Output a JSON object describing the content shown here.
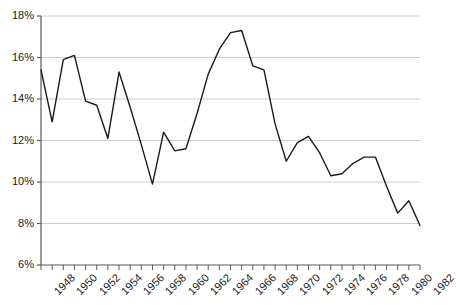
{
  "chart_data": {
    "type": "line",
    "title": "",
    "xlabel": "",
    "ylabel": "",
    "xlim": [
      1948,
      1982
    ],
    "ylim": [
      6,
      18
    ],
    "grid": true,
    "legend": null,
    "y_tick_labels": [
      "18%",
      "16%",
      "14%",
      "12%",
      "10%",
      "8%",
      "6%"
    ],
    "y_ticks": [
      18,
      16,
      14,
      12,
      10,
      8,
      6
    ],
    "x_tick_labels": [
      "1948",
      "1950",
      "1952",
      "1954",
      "1956",
      "1958",
      "1960",
      "1962",
      "1964",
      "1966",
      "1968",
      "1970",
      "1972",
      "1974",
      "1976",
      "1978",
      "1980",
      "1982"
    ],
    "x_ticks": [
      1948,
      1950,
      1952,
      1954,
      1956,
      1958,
      1960,
      1962,
      1964,
      1966,
      1968,
      1970,
      1972,
      1974,
      1976,
      1978,
      1980,
      1982
    ],
    "x": [
      1948,
      1949,
      1950,
      1951,
      1952,
      1953,
      1954,
      1955,
      1956,
      1957,
      1958,
      1959,
      1960,
      1961,
      1962,
      1963,
      1964,
      1965,
      1966,
      1967,
      1968,
      1969,
      1970,
      1971,
      1972,
      1973,
      1974,
      1975,
      1976,
      1977,
      1978,
      1979,
      1980,
      1981,
      1982
    ],
    "values": [
      15.4,
      12.9,
      15.9,
      16.1,
      13.9,
      13.7,
      12.1,
      15.3,
      13.6,
      11.8,
      9.9,
      12.4,
      11.5,
      11.6,
      13.3,
      15.2,
      16.4,
      17.2,
      17.3,
      15.6,
      15.4,
      12.8,
      11.0,
      11.9,
      12.2,
      11.4,
      10.3,
      10.4,
      10.9,
      11.2,
      11.2,
      9.8,
      8.5,
      9.1,
      7.9
    ],
    "series_color": "#1a1a1a",
    "grid_color": "#cccccc",
    "axis_color": "#595959"
  }
}
